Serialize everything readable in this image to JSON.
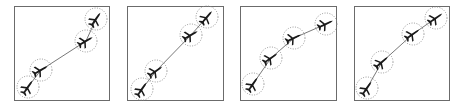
{
  "figure": {
    "colors": {
      "frame": "#6b6b6b",
      "circle": "#8a8a8a",
      "path": "#555555",
      "aircraft": "#1a1a1a"
    },
    "panels": [
      {
        "id": 1,
        "box": [
          14,
          6,
          96,
          95
        ],
        "points": [
          [
            96,
            19
          ],
          [
            86,
            41
          ],
          [
            41,
            70
          ],
          [
            28,
            87
          ]
        ],
        "headings": [
          -55,
          -30,
          -30,
          -55
        ]
      },
      {
        "id": 2,
        "box": [
          127,
          6,
          97,
          95
        ],
        "points": [
          [
            207,
            17
          ],
          [
            191,
            35
          ],
          [
            156,
            71
          ],
          [
            142,
            89
          ]
        ],
        "headings": [
          -50,
          -30,
          -35,
          -55
        ]
      },
      {
        "id": 3,
        "box": [
          240,
          6,
          97,
          95
        ],
        "points": [
          [
            326,
            24
          ],
          [
            294,
            38
          ],
          [
            271,
            58
          ],
          [
            253,
            84
          ]
        ],
        "headings": [
          -25,
          -25,
          -35,
          -55
        ]
      },
      {
        "id": 4,
        "box": [
          354,
          6,
          96,
          95
        ],
        "points": [
          [
            436,
            18
          ],
          [
            413,
            34
          ],
          [
            382,
            62
          ],
          [
            367,
            88
          ]
        ],
        "headings": [
          -35,
          -35,
          -40,
          -55
        ]
      }
    ],
    "circle_radius": 11
  }
}
